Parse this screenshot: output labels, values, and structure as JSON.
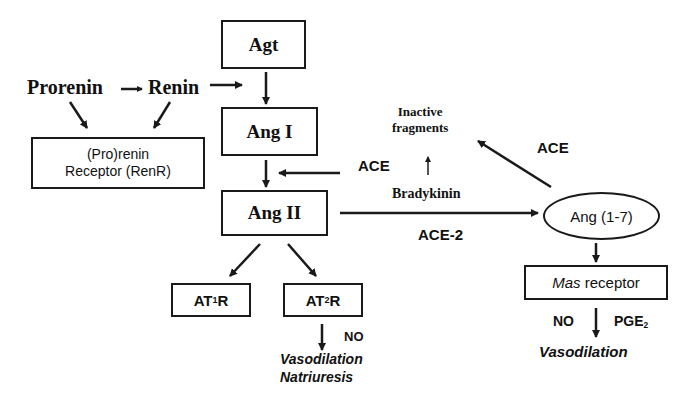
{
  "diagram": {
    "nodes": {
      "agt": "Agt",
      "ang1": "Ang I",
      "ang2": "Ang II",
      "ang17": "Ang (1-7)",
      "prorenin": "Prorenin",
      "renin": "Renin",
      "renr_line1": "(Pro)renin",
      "renr_line2": "Receptor (RenR)",
      "at1r_prefix": "AT",
      "at1r_sub": "1",
      "at1r_suffix": "R",
      "at2r_prefix": "AT",
      "at2r_sub": "2",
      "at2r_suffix": "R",
      "mas_italic": "Mas",
      "mas_rest": " receptor",
      "inactive_line1": "Inactive",
      "inactive_line2": "fragments"
    },
    "edge_labels": {
      "ace_left": "ACE",
      "ace_right": "ACE",
      "bradykinin": "Bradykinin",
      "ace2": "ACE-2",
      "at2_no": "NO",
      "mas_no": "NO",
      "mas_pge_prefix": "PGE",
      "mas_pge_sub": "2"
    },
    "outcomes": {
      "at2_line1": "Vasodilation",
      "at2_line2": "Natriuresis",
      "mas_line1": "Vasodilation"
    },
    "colors": {
      "stroke": "#1a1a1a",
      "text": "#111111",
      "background": "#ffffff"
    }
  }
}
